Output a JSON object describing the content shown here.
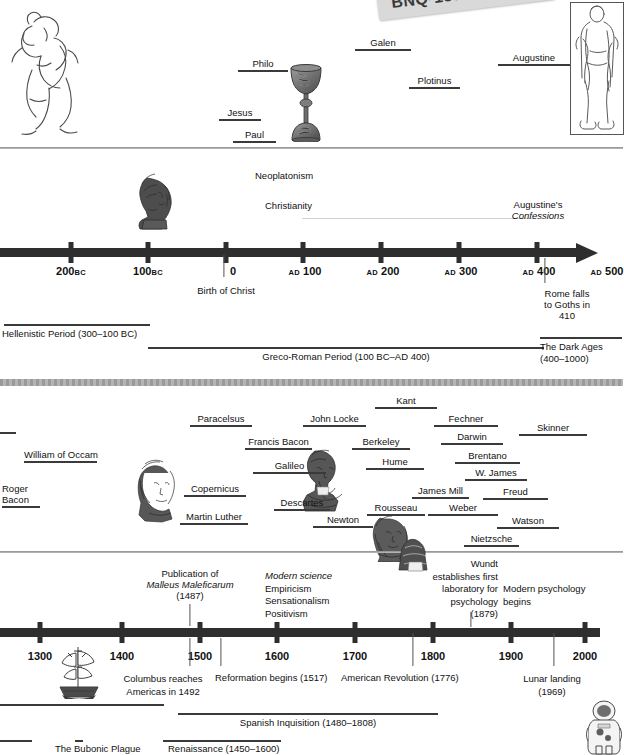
{
  "sticker": {
    "code": "BNQ-158"
  },
  "top_section": {
    "figures": [
      {
        "name": "wrestlers-illustration"
      },
      {
        "name": "chalice-illustration"
      },
      {
        "name": "roman-orator-illustration"
      }
    ],
    "people": [
      {
        "label": "Philo",
        "x": 238,
        "y": 58,
        "w": 50
      },
      {
        "label": "Galen",
        "x": 355,
        "y": 37,
        "w": 56
      },
      {
        "label": "Plotinus",
        "x": 409,
        "y": 75,
        "w": 51
      },
      {
        "label": "Augustine",
        "x": 533,
        "y": 52,
        "w": 62
      },
      {
        "label": "Jesus",
        "x": 234,
        "y": 107,
        "w": 32
      },
      {
        "label": "Paul",
        "x": 250,
        "y": 129,
        "w": 37
      }
    ]
  },
  "ancient_timeline": {
    "movements": [
      {
        "label": "Neoplatonism",
        "x": 302,
        "y": 170
      },
      {
        "label": "Christianity",
        "x": 294,
        "y": 200
      }
    ],
    "augustine_work": {
      "line1": "Augustine's",
      "line2": "Confessions",
      "x": 538,
      "y": 200
    },
    "bust": {
      "name": "philosopher-bust-illustration"
    },
    "ticks": [
      {
        "label": "200",
        "era": "BC",
        "era_side": "after",
        "x": 71
      },
      {
        "label": "100",
        "era": "BC",
        "era_side": "after",
        "x": 148
      },
      {
        "label": "0",
        "era": "",
        "era_side": "",
        "x": 226
      },
      {
        "label": "100",
        "era": "AD",
        "era_side": "before",
        "x": 303
      },
      {
        "label": "200",
        "era": "AD",
        "era_side": "before",
        "x": 381
      },
      {
        "label": "300",
        "era": "AD",
        "era_side": "before",
        "x": 459
      },
      {
        "label": "400",
        "era": "AD",
        "era_side": "before",
        "x": 537
      },
      {
        "label": "500",
        "era": "AD",
        "era_side": "before",
        "x": 610
      }
    ],
    "events": [
      {
        "label": "Birth of Christ",
        "x": 226,
        "y": 285
      },
      {
        "label": "Rome falls\nto Goths in 410",
        "line1": "Rome falls",
        "line2": "to Goths in 410",
        "x": 567,
        "y": 290
      }
    ],
    "periods": [
      {
        "label": "Hellenistic Period (300–100 BC)",
        "bar_x": 4,
        "bar_w": 146,
        "bar_y": 324,
        "lbl_x": 3,
        "lbl_y": 328,
        "align": "left"
      },
      {
        "label": "Greco-Roman Period (100 BC–AD 400)",
        "bar_x": 148,
        "bar_w": 396,
        "bar_y": 347,
        "lbl_x": 346,
        "lbl_y": 351,
        "align": "center"
      },
      {
        "label": "The Dark Ages",
        "label2": "(400–1000)",
        "bar_x": 540,
        "bar_w": 82,
        "bar_y": 337,
        "lbl_x": 540,
        "lbl_y": 341,
        "align": "left"
      }
    ]
  },
  "modern_section": {
    "figures": [
      {
        "name": "copernicus-portrait-illustration"
      },
      {
        "name": "galileo-bust-illustration"
      },
      {
        "name": "newton-portrait-illustration"
      }
    ],
    "people": [
      {
        "label": "William of Occam",
        "x": 24,
        "y": 450,
        "w": 73
      },
      {
        "label": "Roger",
        "x": 3,
        "y": 484,
        "w": 36,
        "line2": "Bacon"
      },
      {
        "label": "Paracelsus",
        "x": 190,
        "y": 414,
        "w": 62
      },
      {
        "label": "Copernicus",
        "x": 184,
        "y": 484,
        "w": 60
      },
      {
        "label": "Martin Luther",
        "x": 182,
        "y": 512,
        "w": 65
      },
      {
        "label": "Francis Bacon",
        "x": 245,
        "y": 437,
        "w": 67
      },
      {
        "label": "Galileo",
        "x": 253,
        "y": 460,
        "w": 73
      },
      {
        "label": "Descartes",
        "x": 274,
        "y": 498,
        "w": 56
      },
      {
        "label": "Newton",
        "x": 317,
        "y": 515,
        "w": 60
      },
      {
        "label": "John Locke",
        "x": 303,
        "y": 414,
        "w": 63
      },
      {
        "label": "Berkeley",
        "x": 355,
        "y": 437,
        "w": 55
      },
      {
        "label": "Hume",
        "x": 366,
        "y": 457,
        "w": 58
      },
      {
        "label": "Rousseau",
        "x": 367,
        "y": 503,
        "w": 56
      },
      {
        "label": "Kant",
        "x": 375,
        "y": 396,
        "w": 62
      },
      {
        "label": "Fechner",
        "x": 434,
        "y": 414,
        "w": 64
      },
      {
        "label": "Darwin",
        "x": 441,
        "y": 432,
        "w": 62
      },
      {
        "label": "Brentano",
        "x": 455,
        "y": 451,
        "w": 65
      },
      {
        "label": "W. James",
        "x": 465,
        "y": 468,
        "w": 62
      },
      {
        "label": "James Mill",
        "x": 412,
        "y": 486,
        "w": 57
      },
      {
        "label": "Weber",
        "x": 428,
        "y": 503,
        "w": 70
      },
      {
        "label": "Freud",
        "x": 483,
        "y": 487,
        "w": 65
      },
      {
        "label": "Watson",
        "x": 497,
        "y": 516,
        "w": 62
      },
      {
        "label": "Nietzsche",
        "x": 464,
        "y": 534,
        "w": 51
      },
      {
        "label": "Skinner",
        "x": 519,
        "y": 423,
        "w": 68
      }
    ]
  },
  "modern_timeline": {
    "ticks": [
      {
        "label": "1300",
        "x": 40
      },
      {
        "label": "1400",
        "x": 122
      },
      {
        "label": "1500",
        "x": 200
      },
      {
        "label": "1600",
        "x": 277
      },
      {
        "label": "1700",
        "x": 355
      },
      {
        "label": "1800",
        "x": 433
      },
      {
        "label": "1900",
        "x": 511
      },
      {
        "label": "2000",
        "x": 585
      }
    ],
    "annotations_above": [
      {
        "line1": "Publication of",
        "line2": "Malleus Maleficarum",
        "line3": "(1487)",
        "x": 190,
        "y": 568,
        "italic_line": 2
      },
      {
        "line1": "Modern science",
        "line2": "Empiricism",
        "line3": "Sensationalism",
        "line4": "Positivism",
        "x": 283,
        "y": 570,
        "italic_line": 1,
        "align": "left"
      },
      {
        "line1": "Wundt",
        "line2": "establishes first",
        "line3": "laboratory for",
        "line4": "psychology",
        "line5": "(1879)",
        "x": 493,
        "y": 558,
        "align": "right"
      },
      {
        "line1": "Modern psychology",
        "line2": "begins",
        "x": 505,
        "y": 578,
        "align": "left"
      }
    ],
    "annotations_below": [
      {
        "line1": "Columbus reaches",
        "line2": "Americas in 1492",
        "x": 163,
        "y": 673
      },
      {
        "line1": "Reformation begins (1517)",
        "x": 215,
        "y": 673
      },
      {
        "line1": "American Revolution (1776)",
        "x": 344,
        "y": 673
      },
      {
        "line1": "Lunar landing",
        "line2": "(1969)",
        "x": 550,
        "y": 673
      }
    ],
    "periods": [
      {
        "label": "Spanish Inquisition (1480–1808)",
        "bar_x": 178,
        "bar_w": 260,
        "bar_y": 713,
        "lbl_x": 308,
        "lbl_y": 717
      },
      {
        "label": "Renaissance (1450–1600)",
        "bar_x": 163,
        "bar_w": 118,
        "bar_y": 740,
        "lbl_x": 168,
        "lbl_y": 742
      },
      {
        "label": "The Bubonic Plague",
        "bar_x": 0,
        "bar_w": 32,
        "bar_y": 740,
        "lbl_x": 55,
        "lbl_y": 742
      }
    ],
    "figures": [
      {
        "name": "sailing-ship-illustration"
      },
      {
        "name": "astronaut-illustration"
      }
    ]
  }
}
